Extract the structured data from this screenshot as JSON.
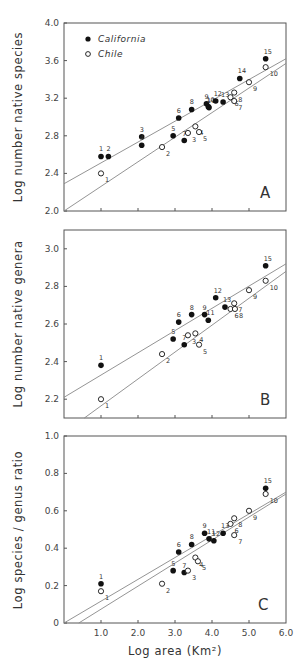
{
  "figure": {
    "x_axis_label": "Log area (Km²)",
    "x_ticks": [
      "1.0",
      "2.0",
      "3.0",
      "4.0",
      "5.0",
      "6.0"
    ],
    "legend": [
      {
        "label": "California",
        "marker": "filled-circle",
        "color": "#111111"
      },
      {
        "label": "Chile",
        "marker": "open-circle",
        "color": "#111111"
      }
    ]
  },
  "chart_data": [
    {
      "type": "scatter",
      "panel": "A",
      "title": "",
      "xlabel": "Log area (Km²)",
      "ylabel": "Log number native species",
      "xlim": [
        0,
        6.0
      ],
      "ylim": [
        2.0,
        4.0
      ],
      "y_ticks": [
        "2.0",
        "2.4",
        "2.8",
        "3.2",
        "3.6",
        "4.0"
      ],
      "y_tick_values": [
        2.0,
        2.4,
        2.8,
        3.2,
        3.6,
        4.0
      ],
      "grid": false,
      "legend_position": "upper-left",
      "series": [
        {
          "name": "California",
          "marker": "filled",
          "points": [
            {
              "id": "1",
              "x": 1.0,
              "y": 2.58
            },
            {
              "id": "2",
              "x": 1.2,
              "y": 2.58
            },
            {
              "id": "3",
              "x": 2.1,
              "y": 2.79
            },
            {
              "id": "4",
              "x": 2.1,
              "y": 2.7
            },
            {
              "id": "5",
              "x": 2.95,
              "y": 2.8
            },
            {
              "id": "6",
              "x": 3.1,
              "y": 2.99
            },
            {
              "id": "7",
              "x": 3.25,
              "y": 2.75
            },
            {
              "id": "8",
              "x": 3.45,
              "y": 3.08
            },
            {
              "id": "9",
              "x": 3.85,
              "y": 3.14
            },
            {
              "id": "10",
              "x": 3.9,
              "y": 3.11
            },
            {
              "id": "11",
              "x": 3.92,
              "y": 3.1
            },
            {
              "id": "12",
              "x": 4.1,
              "y": 3.17
            },
            {
              "id": "13",
              "x": 4.3,
              "y": 3.16
            },
            {
              "id": "14",
              "x": 4.75,
              "y": 3.41
            },
            {
              "id": "15",
              "x": 5.45,
              "y": 3.62
            }
          ],
          "regression": {
            "x0": 0,
            "y0": 2.29,
            "x1": 6.0,
            "y1": 3.62
          }
        },
        {
          "name": "Chile",
          "marker": "open",
          "points": [
            {
              "id": "1",
              "x": 1.0,
              "y": 2.4
            },
            {
              "id": "2",
              "x": 2.65,
              "y": 2.68
            },
            {
              "id": "3",
              "x": 3.35,
              "y": 2.83
            },
            {
              "id": "4",
              "x": 3.55,
              "y": 2.9
            },
            {
              "id": "5",
              "x": 3.65,
              "y": 2.84
            },
            {
              "id": "6",
              "x": 4.5,
              "y": 3.21
            },
            {
              "id": "7",
              "x": 4.6,
              "y": 3.17
            },
            {
              "id": "8",
              "x": 4.6,
              "y": 3.26
            },
            {
              "id": "9",
              "x": 5.0,
              "y": 3.37
            },
            {
              "id": "10",
              "x": 5.45,
              "y": 3.53
            }
          ],
          "regression": {
            "x0": 0,
            "y0": 2.0,
            "x1": 6.0,
            "y1": 3.57
          }
        }
      ]
    },
    {
      "type": "scatter",
      "panel": "B",
      "title": "",
      "xlabel": "Log area (Km²)",
      "ylabel": "Log number native genera",
      "xlim": [
        0,
        6.0
      ],
      "ylim": [
        2.1,
        3.1
      ],
      "y_ticks": [
        "2.2",
        "2.4",
        "2.6",
        "2.8",
        "3.0"
      ],
      "y_tick_values": [
        2.2,
        2.4,
        2.6,
        2.8,
        3.0
      ],
      "grid": false,
      "series": [
        {
          "name": "California",
          "marker": "filled",
          "points": [
            {
              "id": "1",
              "x": 1.0,
              "y": 2.38
            },
            {
              "id": "5",
              "x": 2.95,
              "y": 2.52
            },
            {
              "id": "6",
              "x": 3.1,
              "y": 2.61
            },
            {
              "id": "7",
              "x": 3.25,
              "y": 2.49
            },
            {
              "id": "8",
              "x": 3.45,
              "y": 2.65
            },
            {
              "id": "9",
              "x": 3.8,
              "y": 2.65
            },
            {
              "id": "11",
              "x": 3.9,
              "y": 2.62
            },
            {
              "id": "12",
              "x": 4.1,
              "y": 2.74
            },
            {
              "id": "13",
              "x": 4.35,
              "y": 2.69
            },
            {
              "id": "15",
              "x": 5.45,
              "y": 2.91
            }
          ],
          "regression": {
            "x0": 0,
            "y0": 2.21,
            "x1": 6.0,
            "y1": 2.92
          }
        },
        {
          "name": "Chile",
          "marker": "open",
          "points": [
            {
              "id": "1",
              "x": 1.0,
              "y": 2.2
            },
            {
              "id": "2",
              "x": 2.65,
              "y": 2.44
            },
            {
              "id": "3",
              "x": 3.35,
              "y": 2.54
            },
            {
              "id": "4",
              "x": 3.55,
              "y": 2.55
            },
            {
              "id": "5",
              "x": 3.65,
              "y": 2.49
            },
            {
              "id": "6",
              "x": 4.5,
              "y": 2.68
            },
            {
              "id": "7",
              "x": 4.6,
              "y": 2.71
            },
            {
              "id": "8",
              "x": 4.62,
              "y": 2.68
            },
            {
              "id": "9",
              "x": 5.0,
              "y": 2.78
            },
            {
              "id": "10",
              "x": 5.45,
              "y": 2.83
            }
          ],
          "regression": {
            "x0": 0.55,
            "y0": 2.1,
            "x1": 6.0,
            "y1": 2.88
          }
        }
      ]
    },
    {
      "type": "scatter",
      "panel": "C",
      "title": "",
      "xlabel": "Log area (Km²)",
      "ylabel": "Log species / genus ratio",
      "xlim": [
        0,
        6.0
      ],
      "ylim": [
        0,
        1.0
      ],
      "y_ticks": [
        "0",
        "0.2",
        "0.4",
        "0.6",
        "0.8",
        "1.0"
      ],
      "y_tick_values": [
        0,
        0.2,
        0.4,
        0.6,
        0.8,
        1.0
      ],
      "grid": false,
      "series": [
        {
          "name": "California",
          "marker": "filled",
          "points": [
            {
              "id": "1",
              "x": 1.0,
              "y": 0.21
            },
            {
              "id": "5",
              "x": 2.95,
              "y": 0.28
            },
            {
              "id": "6",
              "x": 3.1,
              "y": 0.38
            },
            {
              "id": "7",
              "x": 3.25,
              "y": 0.27
            },
            {
              "id": "8",
              "x": 3.45,
              "y": 0.42
            },
            {
              "id": "9",
              "x": 3.8,
              "y": 0.48
            },
            {
              "id": "11",
              "x": 3.92,
              "y": 0.45
            },
            {
              "id": "12",
              "x": 4.05,
              "y": 0.44
            },
            {
              "id": "13",
              "x": 4.3,
              "y": 0.48
            },
            {
              "id": "15",
              "x": 5.45,
              "y": 0.72
            }
          ],
          "regression": {
            "x0": 0,
            "y0": 0.0,
            "x1": 6.0,
            "y1": 0.7
          }
        },
        {
          "name": "Chile",
          "marker": "open",
          "points": [
            {
              "id": "1",
              "x": 1.0,
              "y": 0.17
            },
            {
              "id": "2",
              "x": 2.65,
              "y": 0.21
            },
            {
              "id": "3",
              "x": 3.35,
              "y": 0.28
            },
            {
              "id": "4",
              "x": 3.55,
              "y": 0.35
            },
            {
              "id": "5",
              "x": 3.62,
              "y": 0.33
            },
            {
              "id": "6",
              "x": 4.5,
              "y": 0.53
            },
            {
              "id": "7",
              "x": 4.6,
              "y": 0.47
            },
            {
              "id": "8",
              "x": 4.6,
              "y": 0.56
            },
            {
              "id": "9",
              "x": 5.0,
              "y": 0.6
            },
            {
              "id": "10",
              "x": 5.45,
              "y": 0.69
            }
          ],
          "regression": {
            "x0": 0.4,
            "y0": 0.0,
            "x1": 6.0,
            "y1": 0.69
          }
        }
      ]
    }
  ]
}
